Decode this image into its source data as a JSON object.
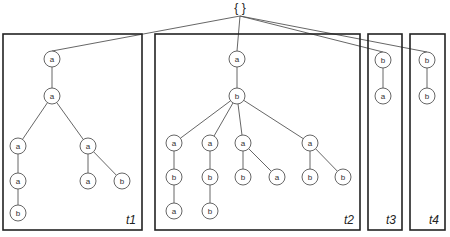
{
  "root": {
    "label": "{ }",
    "x": 240,
    "y": 12
  },
  "colors": {
    "stroke": "#555555",
    "box": "#222222",
    "background": "#ffffff"
  },
  "trees": [
    {
      "id": "t1",
      "label": "t1",
      "box": {
        "x": 3,
        "y": 34,
        "w": 139,
        "h": 196
      },
      "nodes": [
        {
          "id": "n1",
          "label": "a",
          "x": 52,
          "y": 59
        },
        {
          "id": "n2",
          "label": "a",
          "x": 52,
          "y": 96
        },
        {
          "id": "n3",
          "label": "a",
          "x": 18,
          "y": 146
        },
        {
          "id": "n4",
          "label": "a",
          "x": 88,
          "y": 146
        },
        {
          "id": "n5",
          "label": "a",
          "x": 18,
          "y": 181
        },
        {
          "id": "n6",
          "label": "a",
          "x": 88,
          "y": 181
        },
        {
          "id": "n7",
          "label": "b",
          "x": 122,
          "y": 181
        },
        {
          "id": "n8",
          "label": "b",
          "x": 18,
          "y": 213
        }
      ],
      "edges": [
        [
          "n1",
          "n2"
        ],
        [
          "n2",
          "n3"
        ],
        [
          "n2",
          "n4"
        ],
        [
          "n3",
          "n5"
        ],
        [
          "n4",
          "n6"
        ],
        [
          "n4",
          "n7"
        ],
        [
          "n5",
          "n8"
        ]
      ]
    },
    {
      "id": "t2",
      "label": "t2",
      "box": {
        "x": 155,
        "y": 34,
        "w": 205,
        "h": 196
      },
      "nodes": [
        {
          "id": "m1",
          "label": "a",
          "x": 237,
          "y": 59
        },
        {
          "id": "m2",
          "label": "b",
          "x": 237,
          "y": 96
        },
        {
          "id": "m3",
          "label": "a",
          "x": 174,
          "y": 143
        },
        {
          "id": "m4",
          "label": "a",
          "x": 210,
          "y": 143
        },
        {
          "id": "m5",
          "label": "a",
          "x": 243,
          "y": 143
        },
        {
          "id": "m6",
          "label": "a",
          "x": 310,
          "y": 143
        },
        {
          "id": "m7",
          "label": "b",
          "x": 174,
          "y": 177
        },
        {
          "id": "m8",
          "label": "b",
          "x": 210,
          "y": 177
        },
        {
          "id": "m9",
          "label": "b",
          "x": 243,
          "y": 177
        },
        {
          "id": "m10",
          "label": "a",
          "x": 277,
          "y": 177
        },
        {
          "id": "m11",
          "label": "b",
          "x": 310,
          "y": 177
        },
        {
          "id": "m12",
          "label": "b",
          "x": 343,
          "y": 177
        },
        {
          "id": "m13",
          "label": "a",
          "x": 174,
          "y": 211
        },
        {
          "id": "m14",
          "label": "b",
          "x": 210,
          "y": 211
        }
      ],
      "edges": [
        [
          "m1",
          "m2"
        ],
        [
          "m2",
          "m3"
        ],
        [
          "m2",
          "m4"
        ],
        [
          "m2",
          "m5"
        ],
        [
          "m2",
          "m6"
        ],
        [
          "m3",
          "m7"
        ],
        [
          "m4",
          "m8"
        ],
        [
          "m5",
          "m9"
        ],
        [
          "m5",
          "m10"
        ],
        [
          "m6",
          "m11"
        ],
        [
          "m6",
          "m12"
        ],
        [
          "m7",
          "m13"
        ],
        [
          "m8",
          "m14"
        ]
      ]
    },
    {
      "id": "t3",
      "label": "t3",
      "box": {
        "x": 368,
        "y": 34,
        "w": 34,
        "h": 196
      },
      "nodes": [
        {
          "id": "p1",
          "label": "b",
          "x": 383,
          "y": 60
        },
        {
          "id": "p2",
          "label": "a",
          "x": 383,
          "y": 96
        }
      ],
      "edges": [
        [
          "p1",
          "p2"
        ]
      ]
    },
    {
      "id": "t4",
      "label": "t4",
      "box": {
        "x": 410,
        "y": 34,
        "w": 35,
        "h": 196
      },
      "nodes": [
        {
          "id": "q1",
          "label": "b",
          "x": 427,
          "y": 60
        },
        {
          "id": "q2",
          "label": "b",
          "x": 427,
          "y": 96
        }
      ],
      "edges": [
        [
          "q1",
          "q2"
        ]
      ]
    }
  ]
}
